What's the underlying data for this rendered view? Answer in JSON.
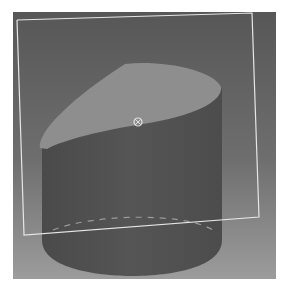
{
  "viewport": {
    "name": "3d-viewport",
    "background_gradient": [
      "#5a5a5a",
      "#9a9a9a"
    ]
  },
  "scene": {
    "object": "cylinder",
    "object_state": "cut-by-plane",
    "colors": {
      "cylinder_body": "#4e4e4e",
      "cut_face": "#8e8e8e",
      "plane_outline": "#e8e8e8",
      "hidden_edge": "#9a9a9a"
    },
    "cut_plane": {
      "handle_icon": "manipulator-handle-icon"
    }
  }
}
